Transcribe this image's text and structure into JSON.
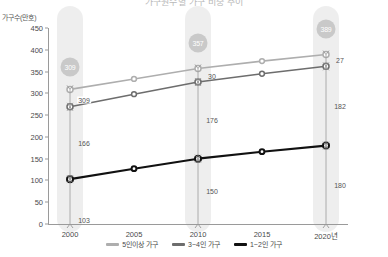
{
  "title": "가구원수별 가구 비중 추이",
  "y_axis_label": "가구수(만호)",
  "legend": [
    {
      "label": "5인이상 가구",
      "color": "#aeaeae"
    },
    {
      "label": "3~4인 가구",
      "color": "#6d6d6d"
    },
    {
      "label": "1~2인 가구",
      "color": "#111111"
    }
  ],
  "bubbles": [
    {
      "value": "309",
      "x": 2000
    },
    {
      "value": "357",
      "x": 2010
    },
    {
      "value": "389",
      "x": 2020
    }
  ],
  "annotations": [
    {
      "text": "309",
      "group": "2000"
    },
    {
      "text": "166",
      "group": "2000"
    },
    {
      "text": "103",
      "group": "2000"
    },
    {
      "text": "30",
      "group": "2010"
    },
    {
      "text": "176",
      "group": "2010"
    },
    {
      "text": "150",
      "group": "2010"
    },
    {
      "text": "27",
      "group": "2020"
    },
    {
      "text": "182",
      "group": "2020"
    },
    {
      "text": "180",
      "group": "2020"
    }
  ],
  "chart_data": {
    "type": "line",
    "title": "가구원수별 가구 비중 추이",
    "xlabel": "",
    "ylabel": "가구수(만호)",
    "ylim": [
      0,
      450
    ],
    "ytick_step": 50,
    "yticks": [
      0,
      50,
      100,
      150,
      200,
      250,
      300,
      350,
      400,
      450
    ],
    "grid": false,
    "legend_position": "bottom",
    "x": [
      2000,
      2005,
      2010,
      2015,
      2020
    ],
    "xtick_labels": [
      "2000",
      "2005",
      "2010",
      "2015",
      "2020년"
    ],
    "cumulative": true,
    "series": [
      {
        "name": "1~2인 가구",
        "color": "#111111",
        "values": [
          103,
          127,
          150,
          166,
          180
        ]
      },
      {
        "name": "3~4인 가구",
        "color": "#6d6d6d",
        "values": [
          269,
          298,
          326,
          345,
          362
        ],
        "segment_values": [
          166,
          171,
          176,
          179,
          182
        ]
      },
      {
        "name": "5인이상 가구",
        "color": "#aeaeae",
        "values": [
          309,
          333,
          357,
          374,
          389
        ],
        "segment_values": [
          40,
          35,
          30,
          29,
          27
        ]
      }
    ],
    "callout_totals": {
      "2000": 309,
      "2010": 357,
      "2020": 389
    },
    "segment_labels": {
      "2000": {
        "5plus_top_total": 309,
        "3to4": 166,
        "1to2": 103
      },
      "2010": {
        "5plus": 30,
        "3to4": 176,
        "1to2": 150
      },
      "2020": {
        "5plus": 27,
        "3to4": 182,
        "1to2": 180
      }
    }
  }
}
